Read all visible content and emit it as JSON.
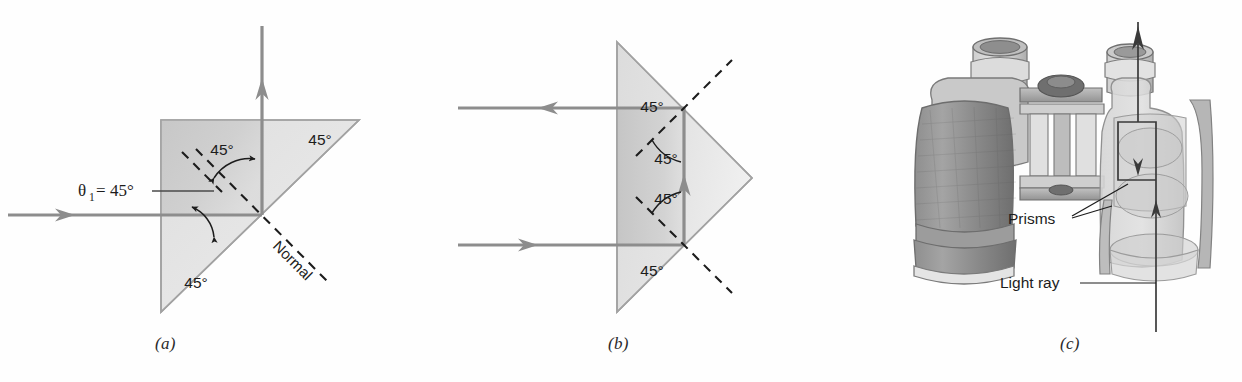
{
  "figure": {
    "background": "#fefefe",
    "ray_color": "#8d8d8d",
    "glass_fill_light": "#e2e2e2",
    "glass_fill_dark": "#c9c9c9",
    "outline_color": "#9a9a9a",
    "text_color": "#1c1c1c"
  },
  "panels": [
    {
      "id": "a",
      "caption": "(a)",
      "description": "Single 45-45-90 prism, ray enters horizontally and totally internally reflects upward",
      "angle_labels": [
        {
          "name": "top-right-45",
          "text": "45°"
        },
        {
          "name": "bottom-left-45",
          "text": "45°"
        },
        {
          "name": "reflection-45",
          "text": "45°"
        }
      ],
      "theta": {
        "symbol": "θ",
        "subscript": "1",
        "equals": " = ",
        "value": "45°",
        "full": "θ₁ = 45°"
      },
      "normal_label": "Normal"
    },
    {
      "id": "b",
      "caption": "(b)",
      "description": "Porro-style prism with apex at right; two horizontal rays reflect internally and reverse direction",
      "angle_labels": [
        {
          "name": "upper-interior-45",
          "text": "45°"
        },
        {
          "name": "upper-reflection-45",
          "text": "45°"
        },
        {
          "name": "lower-reflection-45",
          "text": "45°"
        },
        {
          "name": "lower-interior-45",
          "text": "45°"
        }
      ]
    },
    {
      "id": "c",
      "caption": "(c)",
      "description": "Cutaway drawing of binoculars showing internal prisms and the folded light ray path",
      "labels": [
        {
          "name": "prisms-label",
          "text": "Prisms"
        },
        {
          "name": "light-ray-label",
          "text": "Light ray"
        }
      ]
    }
  ]
}
